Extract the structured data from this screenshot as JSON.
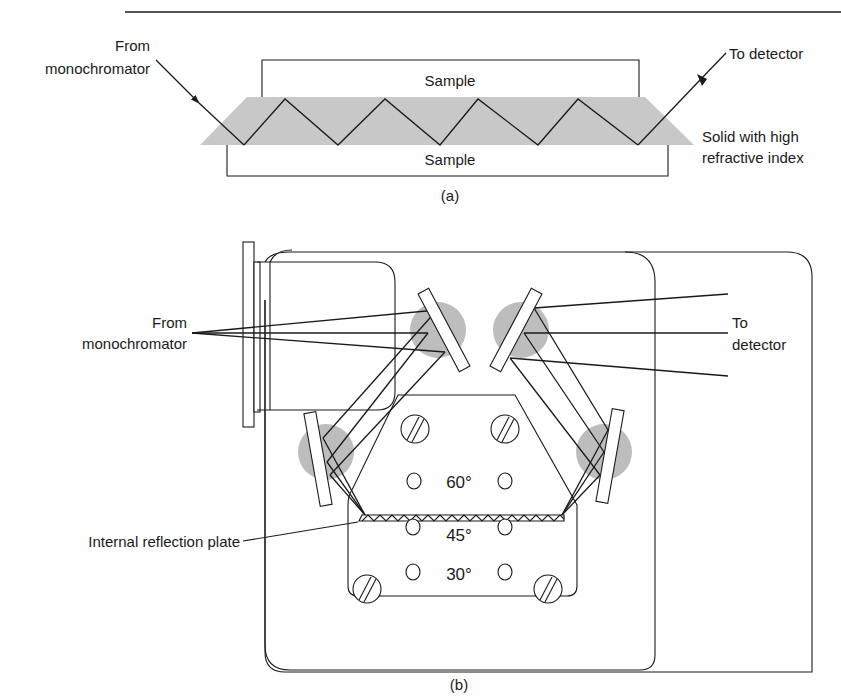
{
  "figure": {
    "panel_a": {
      "caption": "(a)",
      "labels": {
        "input": [
          "From",
          "monochromator"
        ],
        "output": "To detector",
        "sample_top": "Sample",
        "sample_bottom": "Sample",
        "crystal": [
          "Solid with high",
          "refractive index"
        ]
      },
      "reflections": 10
    },
    "panel_b": {
      "caption": "(b)",
      "labels": {
        "input": [
          "From",
          "monochromator"
        ],
        "output": [
          "To",
          "detector"
        ],
        "plate": "Internal reflection plate"
      },
      "angle_positions": [
        "60°",
        "45°",
        "30°"
      ],
      "mirrors": 4,
      "screws": 4
    },
    "colors": {
      "ink": "#1a1a1a",
      "crystal_fill": "#c8c8c8",
      "mirror_spot": "#bdbdbd",
      "background": "#ffffff"
    }
  }
}
